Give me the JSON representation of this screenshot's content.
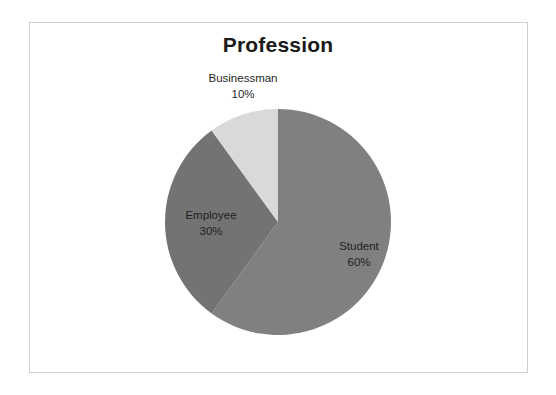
{
  "slide": {
    "background_color": "#ffffff",
    "frame_color": "#cfcfcf"
  },
  "chart_data": {
    "type": "pie",
    "title": "Profession",
    "xlabel": "",
    "ylabel": "",
    "categories": [
      "Student",
      "Employee",
      "Businessman"
    ],
    "values": [
      60,
      30,
      10
    ],
    "value_unit": "%",
    "labels": [
      {
        "name": "Student",
        "value": "60%",
        "percent": 60,
        "color": "#808080",
        "position": "inside-right"
      },
      {
        "name": "Employee",
        "value": "30%",
        "percent": 30,
        "color": "#737373",
        "position": "inside-left"
      },
      {
        "name": "Businessman",
        "value": "10%",
        "percent": 10,
        "color": "#d9d9d9",
        "position": "outside-top"
      }
    ],
    "start_angle_deg": 0,
    "direction": "clockwise",
    "legend": "none",
    "grid": false,
    "colors": [
      "#808080",
      "#737373",
      "#d9d9d9"
    ]
  }
}
